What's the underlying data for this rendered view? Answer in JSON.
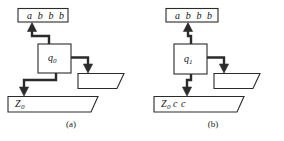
{
  "figure": {
    "type": "pda-configuration-diagram",
    "stroke_color": "#2b2b2b",
    "fill_color": "#ffffff",
    "background": "#ffffff",
    "panels": [
      {
        "id": "a",
        "caption": "(a)",
        "input_tape": {
          "label": "a b b b",
          "symbols": [
            "a",
            "b",
            "b",
            "b"
          ]
        },
        "state": {
          "label": "q",
          "subscript": "0"
        },
        "stack": {
          "label": "Z",
          "subscript": "0",
          "suffix": "",
          "contents": [
            "Z0"
          ]
        },
        "output_tape": {
          "label": "",
          "contents": []
        },
        "arrows": [
          {
            "name": "state-to-input-tape",
            "direction": "up"
          },
          {
            "name": "state-to-output-tape",
            "direction": "right-down"
          },
          {
            "name": "state-to-stack",
            "direction": "down-left"
          }
        ]
      },
      {
        "id": "b",
        "caption": "(b)",
        "input_tape": {
          "label": "a b b b",
          "symbols": [
            "a",
            "b",
            "b",
            "b"
          ]
        },
        "state": {
          "label": "q",
          "subscript": "1"
        },
        "stack": {
          "label": "Z",
          "subscript": "0",
          "suffix": "c c",
          "contents": [
            "Z0",
            "c",
            "c"
          ]
        },
        "output_tape": {
          "label": "",
          "contents": []
        },
        "arrows": [
          {
            "name": "state-to-input-tape",
            "direction": "up"
          },
          {
            "name": "state-to-output-tape",
            "direction": "right-down"
          },
          {
            "name": "state-to-stack",
            "direction": "down"
          }
        ]
      }
    ]
  }
}
